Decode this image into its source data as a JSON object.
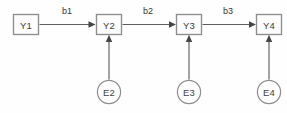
{
  "diagram": {
    "type": "path-diagram",
    "title": "",
    "canvas": {
      "width": 287,
      "height": 113,
      "background": "#fefefe"
    },
    "colors": {
      "node_stroke": "#8a8a8a",
      "node_fill": "#fdfdfd",
      "edge_stroke": "#5a5a5a",
      "arrowhead": "#3f3f3f",
      "node_text": "#3a3a3a",
      "edge_label_text": "#2e2e2e"
    },
    "observed_nodes": [
      {
        "id": "Y1",
        "label": "Y1",
        "shape": "rect",
        "x": 13,
        "y": 14,
        "w": 26,
        "h": 21
      },
      {
        "id": "Y2",
        "label": "Y2",
        "shape": "rect",
        "x": 96,
        "y": 14,
        "w": 26,
        "h": 21
      },
      {
        "id": "Y3",
        "label": "Y3",
        "shape": "rect",
        "x": 176,
        "y": 14,
        "w": 26,
        "h": 21
      },
      {
        "id": "Y4",
        "label": "Y4",
        "shape": "rect",
        "x": 256,
        "y": 14,
        "w": 26,
        "h": 21
      },
      {
        "id": "E2",
        "label": "E2",
        "shape": "circle",
        "cx": 109,
        "cy": 92,
        "r": 12
      },
      {
        "id": "E3",
        "label": "E3",
        "shape": "circle",
        "cx": 189,
        "cy": 92,
        "r": 12
      },
      {
        "id": "E4",
        "label": "E4",
        "shape": "circle",
        "cx": 269,
        "cy": 92,
        "r": 12
      }
    ],
    "observed_edges": [
      {
        "from": "Y1",
        "to": "Y2",
        "label": "b1",
        "direction": "horizontal"
      },
      {
        "from": "Y2",
        "to": "Y3",
        "label": "b2",
        "direction": "horizontal"
      },
      {
        "from": "Y3",
        "to": "Y4",
        "label": "b3",
        "direction": "horizontal"
      },
      {
        "from": "E2",
        "to": "Y2",
        "label": "",
        "direction": "vertical"
      },
      {
        "from": "E3",
        "to": "Y3",
        "label": "",
        "direction": "vertical"
      },
      {
        "from": "E4",
        "to": "Y4",
        "label": "",
        "direction": "vertical"
      }
    ],
    "nodes": {
      "y1": {
        "label": "Y1"
      },
      "y2": {
        "label": "Y2"
      },
      "y3": {
        "label": "Y3"
      },
      "y4": {
        "label": "Y4"
      },
      "e2": {
        "label": "E2"
      },
      "e3": {
        "label": "E3"
      },
      "e4": {
        "label": "E4"
      }
    },
    "edge_labels": {
      "b1": "b1",
      "b2": "b2",
      "b3": "b3"
    }
  }
}
